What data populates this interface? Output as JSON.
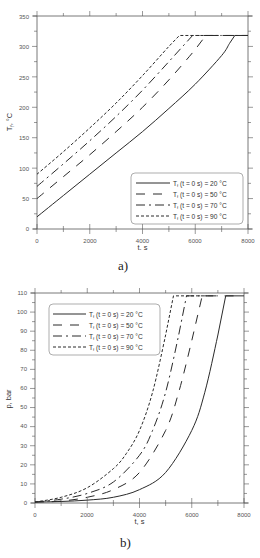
{
  "chart_data": [
    {
      "id": "a",
      "type": "line",
      "caption": "a)",
      "xlabel": "t, s",
      "ylabel": "Tf, °C",
      "xlim": [
        0,
        8000
      ],
      "ylim": [
        0,
        350
      ],
      "xticks": [
        0,
        2000,
        4000,
        6000,
        8000
      ],
      "yticks": [
        0,
        50,
        100,
        150,
        200,
        250,
        300,
        350
      ],
      "grid": false,
      "legend_position": "lower right",
      "series": [
        {
          "name": "Tf (t = 0 s) = 20 °C",
          "style": "solid",
          "x": [
            0,
            1000,
            2000,
            3000,
            4000,
            5000,
            6000,
            7000,
            7300,
            7500,
            8000
          ],
          "y": [
            20,
            55,
            90,
            125,
            160,
            198,
            238,
            285,
            305,
            318,
            318
          ]
        },
        {
          "name": "Tf (t = 0 s) = 50 °C",
          "style": "long-dash",
          "x": [
            0,
            1000,
            2000,
            3000,
            4000,
            5000,
            6000,
            6400,
            8000
          ],
          "y": [
            50,
            86,
            122,
            160,
            200,
            245,
            295,
            318,
            318
          ]
        },
        {
          "name": "Tf (t = 0 s) = 70 °C",
          "style": "dash-dot",
          "x": [
            0,
            1000,
            2000,
            3000,
            4000,
            5000,
            5900,
            8000
          ],
          "y": [
            70,
            107,
            145,
            185,
            228,
            275,
            318,
            318
          ]
        },
        {
          "name": "Tf (t = 0 s) = 90 °C",
          "style": "short-dash",
          "x": [
            0,
            1000,
            2000,
            3000,
            4000,
            5000,
            5400,
            7000
          ],
          "y": [
            90,
            127,
            166,
            207,
            252,
            300,
            318,
            318
          ]
        }
      ]
    },
    {
      "id": "b",
      "type": "line",
      "caption": "b)",
      "xlabel": "t, s",
      "ylabel": "p, bar",
      "xlim": [
        0,
        8000
      ],
      "ylim": [
        0,
        110
      ],
      "xticks": [
        0,
        2000,
        4000,
        6000,
        8000
      ],
      "yticks": [
        0,
        10,
        20,
        30,
        40,
        50,
        60,
        70,
        80,
        90,
        100,
        110
      ],
      "grid": false,
      "legend_position": "upper left",
      "series": [
        {
          "name": "Tf (t = 0 s) = 20 °C",
          "style": "solid",
          "x": [
            0,
            1000,
            2000,
            3000,
            4000,
            5000,
            6000,
            6500,
            7000,
            7300,
            8000
          ],
          "y": [
            0.5,
            0.8,
            1.5,
            3,
            7,
            16,
            38,
            58,
            88,
            108.5,
            108.5
          ]
        },
        {
          "name": "Tf (t = 0 s) = 50 °C",
          "style": "long-dash",
          "x": [
            0,
            1000,
            2000,
            3000,
            4000,
            5000,
            5500,
            6000,
            6400,
            7600
          ],
          "y": [
            0.5,
            1,
            3,
            7,
            16,
            38,
            58,
            85,
            108.5,
            108.5
          ]
        },
        {
          "name": "Tf (t = 0 s) = 70 °C",
          "style": "dash-dot",
          "x": [
            0,
            1000,
            2000,
            3000,
            4000,
            4500,
            5000,
            5500,
            5800,
            7000
          ],
          "y": [
            0.5,
            2,
            5,
            11,
            25,
            38,
            58,
            88,
            108.5,
            108.5
          ]
        },
        {
          "name": "Tf (t = 0 s) = 90 °C",
          "style": "short-dash",
          "x": [
            0,
            1000,
            2000,
            3000,
            3500,
            4000,
            4500,
            5000,
            5300,
            6600
          ],
          "y": [
            0.5,
            3,
            8,
            18,
            26,
            38,
            58,
            88,
            108.5,
            108.5
          ]
        }
      ]
    }
  ],
  "charts": {
    "a": {
      "caption": "a)",
      "xlabel": "t, s",
      "ylabel_main": "T",
      "ylabel_sub": "f",
      "ylabel_rest": ", °C",
      "xtick_labels": [
        "0",
        "2000",
        "4000",
        "6000",
        "8000"
      ],
      "ytick_labels": [
        "0",
        "50",
        "100",
        "150",
        "200",
        "250",
        "300",
        "350"
      ],
      "legend": [
        {
          "main": "T",
          "sub": "f",
          "rest": " (t = 0 s) = 20 °C"
        },
        {
          "main": "T",
          "sub": "f",
          "rest": " (t = 0 s) = 50 °C"
        },
        {
          "main": "T",
          "sub": "f",
          "rest": " (t = 0 s) = 70 °C"
        },
        {
          "main": "T",
          "sub": "f",
          "rest": " (t = 0 s) = 90 °C"
        }
      ]
    },
    "b": {
      "caption": "b)",
      "xlabel": "t, s",
      "ylabel": "p, bar",
      "xtick_labels": [
        "0",
        "2000",
        "4000",
        "6000",
        "8000"
      ],
      "ytick_labels": [
        "0",
        "10",
        "20",
        "30",
        "40",
        "50",
        "60",
        "70",
        "80",
        "90",
        "100",
        "110"
      ],
      "legend": [
        {
          "main": "T",
          "sub": "f",
          "rest": " (t = 0 s) = 20 °C"
        },
        {
          "main": "T",
          "sub": "f",
          "rest": " (t = 0 s) = 50 °C"
        },
        {
          "main": "T",
          "sub": "f",
          "rest": " (t = 0 s) = 70 °C"
        },
        {
          "main": "T",
          "sub": "f",
          "rest": " (t = 0 s) = 90 °C"
        }
      ]
    }
  },
  "colors": {
    "line": "#2a2a2a",
    "axis": "#555555",
    "background": "#ffffff"
  }
}
